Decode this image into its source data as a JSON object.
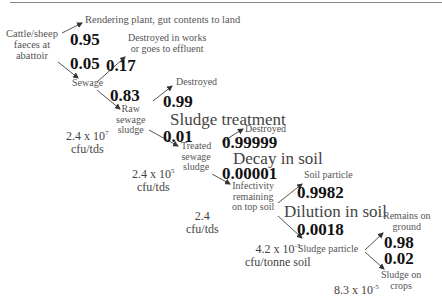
{
  "nodes": {
    "source": "Cattle/sheep faeces at abattoir",
    "source_lines": [
      "Cattle/sheep",
      "faeces at",
      "abattoir"
    ],
    "rendering": "Rendering plant, gut contents to land",
    "sewage": "Sewage",
    "destroyed_works_lines": [
      "Destroyed in works",
      "or goes to effluent"
    ],
    "raw_sludge_lines": [
      "Raw",
      "sewage",
      "sludge"
    ],
    "destroyed_1": "Destroyed",
    "treated_sludge_lines": [
      "Treated",
      "sewage",
      "sludge"
    ],
    "destroyed_2": "Destroyed",
    "infectivity_lines": [
      "Infectivity",
      "remaining",
      "on top soil"
    ],
    "soil_particle": "Soil particle",
    "sludge_particle": "Sludge particle",
    "remains_ground_lines": [
      "Remains on",
      "ground"
    ],
    "sludge_crops_lines": [
      "Sludge on",
      "crops"
    ]
  },
  "probabilities": {
    "to_rendering": "0.95",
    "to_sewage": "0.05",
    "destroyed_works": "0.17",
    "to_raw_sludge": "0.83",
    "sludge_destroyed": "0.99",
    "to_treated": "0.01",
    "decay_destroyed": "0.99999",
    "to_infectivity": "0.00001",
    "to_soil_particle": "0.9982",
    "to_sludge_particle": "0.0018",
    "remains_ground": "0.98",
    "sludge_on_crops": "0.02"
  },
  "stages": {
    "sludge_treatment": "Sludge treatment",
    "decay_in_soil": "Decay in soil",
    "dilution_in_soil": "Dilution in soil"
  },
  "concentrations": {
    "c1_base": "2.4 x 10",
    "c1_exp": "7",
    "c1_unit": "cfu/tds",
    "c2_base": "2.4 x 10",
    "c2_exp": "5",
    "c2_unit": "cfu/tds",
    "c3_base": "2.4",
    "c3_unit": "cfu/tds",
    "c4_base": "4.2 x 10",
    "c4_exp": "-3",
    "c4_unit": "cfu/tonne soil",
    "c5_base": "8.3 x 10",
    "c5_exp": "-5"
  },
  "colors": {
    "arrow": "#333333",
    "text": "#444444",
    "prob": "#111111"
  }
}
